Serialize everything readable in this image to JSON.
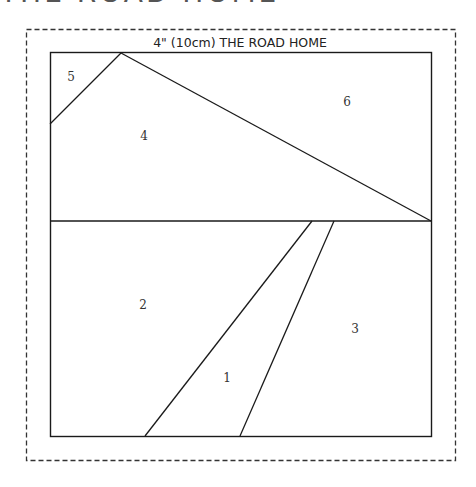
{
  "page": {
    "clipped_heading": "THE ROAD HOME"
  },
  "diagram": {
    "title": "4\" (10cm) THE ROAD HOME",
    "colors": {
      "line": "#1a1a1a",
      "dash": "#333333",
      "background": "#ffffff"
    },
    "seam_allowance_border": {
      "x": 26,
      "y": 29,
      "width": 429,
      "height": 431,
      "style": "dashed"
    },
    "block": {
      "x": 50,
      "y": 52,
      "width": 381,
      "height": 384
    },
    "pieces": [
      {
        "number": "1",
        "label_x": 227,
        "label_y": 382
      },
      {
        "number": "2",
        "label_x": 143,
        "label_y": 309
      },
      {
        "number": "3",
        "label_x": 355,
        "label_y": 333
      },
      {
        "number": "4",
        "label_x": 144,
        "label_y": 140
      },
      {
        "number": "5",
        "label_x": 71,
        "label_y": 81
      },
      {
        "number": "6",
        "label_x": 347,
        "label_y": 106
      }
    ],
    "labels": {
      "p1": "1",
      "p2": "2",
      "p3": "3",
      "p4": "4",
      "p5": "5",
      "p6": "6"
    }
  }
}
